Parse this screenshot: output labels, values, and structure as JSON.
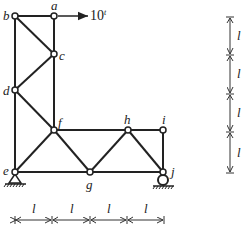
{
  "diagram": {
    "type": "truss",
    "nodes": [
      {
        "id": "a",
        "label": "a",
        "x": 54,
        "y": 16
      },
      {
        "id": "b",
        "label": "b",
        "x": 15,
        "y": 16
      },
      {
        "id": "c",
        "label": "c",
        "x": 54,
        "y": 54
      },
      {
        "id": "d",
        "label": "d",
        "x": 15,
        "y": 90
      },
      {
        "id": "e",
        "label": "e",
        "x": 15,
        "y": 172
      },
      {
        "id": "f",
        "label": "f",
        "x": 54,
        "y": 130
      },
      {
        "id": "g",
        "label": "g",
        "x": 90,
        "y": 172
      },
      {
        "id": "h",
        "label": "h",
        "x": 128,
        "y": 130
      },
      {
        "id": "i",
        "label": "i",
        "x": 163,
        "y": 130
      },
      {
        "id": "j",
        "label": "j",
        "x": 163,
        "y": 172
      }
    ],
    "members": [
      [
        "b",
        "a"
      ],
      [
        "a",
        "c"
      ],
      [
        "b",
        "c"
      ],
      [
        "b",
        "d"
      ],
      [
        "c",
        "d"
      ],
      [
        "c",
        "f"
      ],
      [
        "d",
        "f"
      ],
      [
        "d",
        "e"
      ],
      [
        "e",
        "f"
      ],
      [
        "e",
        "g"
      ],
      [
        "f",
        "g"
      ],
      [
        "f",
        "h"
      ],
      [
        "g",
        "h"
      ],
      [
        "h",
        "i"
      ],
      [
        "h",
        "j"
      ],
      [
        "g",
        "j"
      ],
      [
        "i",
        "j"
      ]
    ],
    "load": {
      "node": "a",
      "label": "10",
      "superscript": "t",
      "direction": "right"
    },
    "supports": [
      {
        "node": "e",
        "type": "pin"
      },
      {
        "node": "j",
        "type": "roller"
      }
    ],
    "dimensions": {
      "horizontal": {
        "labels": [
          "l",
          "l",
          "l",
          "l"
        ]
      },
      "vertical": {
        "labels": [
          "l",
          "l",
          "l",
          "l"
        ]
      }
    }
  }
}
